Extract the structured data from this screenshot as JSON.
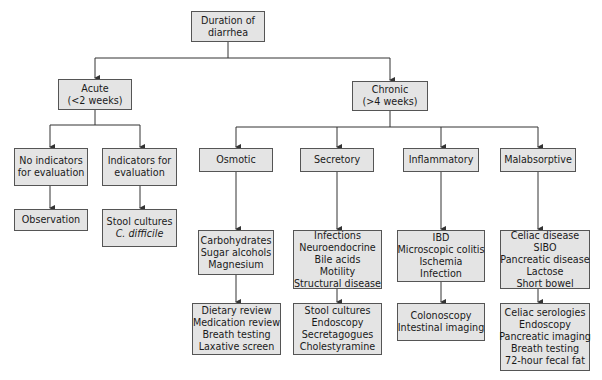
{
  "diagram": {
    "root": {
      "lines": [
        "Duration of",
        "diarrhea"
      ]
    },
    "acute": {
      "lines": [
        "Acute",
        "(<2 weeks)"
      ],
      "children": [
        {
          "label": [
            "No indicators",
            "for evaluation"
          ],
          "result": [
            "Observation"
          ]
        },
        {
          "label": [
            "Indicators for",
            "evaluation"
          ],
          "result": [
            "Stool cultures",
            "C. difficile"
          ]
        }
      ]
    },
    "chronic": {
      "lines": [
        "Chronic",
        "(>4 weeks)"
      ],
      "children": [
        {
          "label": [
            "Osmotic"
          ],
          "causes": [
            "Carbohydrates",
            "Sugar alcohols",
            "Magnesium"
          ],
          "tests": [
            "Dietary review",
            "Medication review",
            "Breath testing",
            "Laxative screen"
          ]
        },
        {
          "label": [
            "Secretory"
          ],
          "causes": [
            "Infections",
            "Neuroendocrine",
            "Bile acids",
            "Motility",
            "Structural disease"
          ],
          "tests": [
            "Stool cultures",
            "Endoscopy",
            "Secretagogues",
            "Cholestyramine"
          ]
        },
        {
          "label": [
            "Inflammatory"
          ],
          "causes": [
            "IBD",
            "Microscopic colitis",
            "Ischemia",
            "Infection"
          ],
          "tests": [
            "Colonoscopy",
            "Intestinal imaging"
          ]
        },
        {
          "label": [
            "Malabsorptive"
          ],
          "causes": [
            "Celiac disease",
            "SIBO",
            "Pancreatic disease",
            "Lactose",
            "Short bowel"
          ],
          "tests": [
            "Celiac serologies",
            "Endoscopy",
            "Pancreatic imaging",
            "Breath testing",
            "72-hour fecal fat"
          ]
        }
      ]
    }
  },
  "colors": {
    "box_fill": "#e4e4e4",
    "border": "#555555",
    "line": "#333333"
  }
}
